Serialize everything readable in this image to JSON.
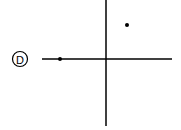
{
  "option": {
    "label": "D",
    "cx": 20,
    "cy": 59,
    "r": 7.5
  },
  "axes": {
    "color": "#000000",
    "origin": {
      "x": 106,
      "y": 59
    },
    "x_axis": {
      "x1": 42,
      "x2": 172,
      "y": 59
    },
    "y_axis": {
      "x": 106,
      "y1": 0,
      "y2": 126
    }
  },
  "points": [
    {
      "name": "point-on-negative-x-axis",
      "x": 60,
      "y": 59
    },
    {
      "name": "point-in-first-quadrant",
      "x": 127,
      "y": 25
    }
  ]
}
